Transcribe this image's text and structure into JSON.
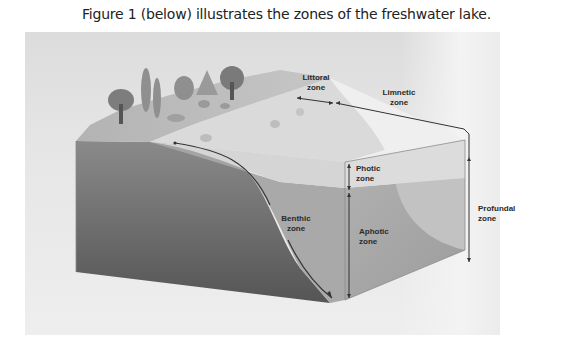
{
  "caption": "Figure 1 (below) illustrates the zones of the freshwater lake.",
  "figure": {
    "labels": {
      "littoral": [
        "Littoral",
        "zone"
      ],
      "limnetic": [
        "Limnetic",
        "zone"
      ],
      "photic": [
        "Photic",
        "zone"
      ],
      "aphotic": [
        "Aphotic",
        "zone"
      ],
      "benthic": [
        "Benthic",
        "zone"
      ],
      "profundal": [
        "Profundal",
        "zone"
      ]
    },
    "colors": {
      "panel_bg": "#e4e4e4",
      "land_top": "#b9b9b9",
      "shallow_water": "#d9d9d9",
      "photic_layer": "#d3d3d3",
      "aphotic_layer": "#a9a9a9",
      "sediment_front": "#6f6f6f",
      "arrow": "#333333"
    }
  }
}
